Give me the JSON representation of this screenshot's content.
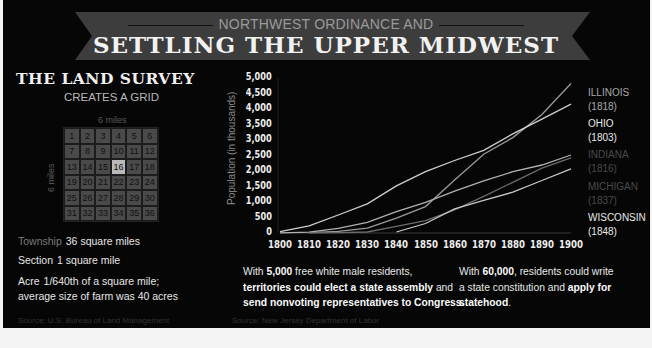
{
  "header": {
    "subtitle": "NORTHWEST ORDINANCE AND",
    "title": "SETTLING THE UPPER MIDWEST"
  },
  "land_survey": {
    "title": "THE LAND SURVEY",
    "subtitle": "CREATES A GRID",
    "width_label": "6 miles",
    "height_label": "6 miles",
    "highlighted_section": 16,
    "sections": [
      "1",
      "2",
      "3",
      "4",
      "5",
      "6",
      "7",
      "8",
      "9",
      "10",
      "11",
      "12",
      "13",
      "14",
      "15",
      "16",
      "17",
      "18",
      "19",
      "20",
      "21",
      "22",
      "23",
      "24",
      "25",
      "26",
      "27",
      "28",
      "29",
      "30",
      "31",
      "32",
      "33",
      "34",
      "35",
      "36"
    ],
    "definitions": [
      {
        "term": "Township",
        "text": "36 square miles"
      },
      {
        "term": "Section",
        "text": "1 square mile"
      },
      {
        "term": "Acre",
        "text": "1/640th of a square mile;",
        "text2": "average size of farm was 40 acres"
      }
    ],
    "source": "Source: U.S. Bureau of Land Management"
  },
  "chart_data": {
    "type": "line",
    "title": "",
    "xlabel": "",
    "ylabel": "Population (in thousands)",
    "x": [
      1800,
      1810,
      1820,
      1830,
      1840,
      1850,
      1860,
      1870,
      1880,
      1890,
      1900
    ],
    "x_tick_labels": [
      "1800",
      "1810",
      "1820",
      "1830",
      "1840",
      "1850",
      "1860",
      "1870",
      "1880",
      "1890",
      "1900"
    ],
    "y_tick_labels": [
      "5,000",
      "4,500",
      "4,000",
      "3,500",
      "3,000",
      "2,500",
      "2,000",
      "1,500",
      "1,000",
      "500",
      "0"
    ],
    "ylim": [
      0,
      5000
    ],
    "grid": false,
    "legend_position": "right",
    "series": [
      {
        "name": "ILLINOIS",
        "admitted": "(1818)",
        "color": "#9a9a9a",
        "label_color": "#a8a8a8",
        "values": [
          null,
          12,
          55,
          157,
          476,
          851,
          1712,
          2540,
          3078,
          3826,
          4822
        ]
      },
      {
        "name": "OHIO",
        "admitted": "(1803)",
        "color": "#cfcfcf",
        "label_color": "#e8e8e8",
        "values": [
          45,
          231,
          581,
          938,
          1519,
          1980,
          2340,
          2665,
          3198,
          3672,
          4158
        ]
      },
      {
        "name": "INDIANA",
        "admitted": "(1816)",
        "color": "#b0b0b0",
        "label_color": "#4a4a4a",
        "values": [
          6,
          25,
          147,
          343,
          686,
          988,
          1350,
          1681,
          1978,
          2192,
          2516
        ]
      },
      {
        "name": "MICHIGAN",
        "admitted": "(1837)",
        "color": "#6c6c6c",
        "label_color": "#4a4a4a",
        "values": [
          null,
          5,
          9,
          32,
          212,
          398,
          749,
          1184,
          1637,
          2094,
          2421
        ]
      },
      {
        "name": "WISCONSIN",
        "admitted": "(1848)",
        "color": "#c8c8c8",
        "label_color": "#e8e8e8",
        "values": [
          null,
          null,
          null,
          null,
          31,
          305,
          776,
          1055,
          1315,
          1693,
          2069
        ]
      }
    ],
    "source": "Source: New Jersey Department of Labor"
  },
  "notes": {
    "left": {
      "p1": "With ",
      "b1": "5,000",
      "p2": " free white male residents,",
      "b2": "territories could elect a state assembly",
      "p3": " and",
      "b3": "send nonvoting representatives to Congress."
    },
    "right": {
      "p1": "With ",
      "b1": "60,000",
      "p2": ", residents could write",
      "p3": "a state constitution and ",
      "b2": "apply for",
      "b3": "statehood",
      "p4": "."
    }
  }
}
